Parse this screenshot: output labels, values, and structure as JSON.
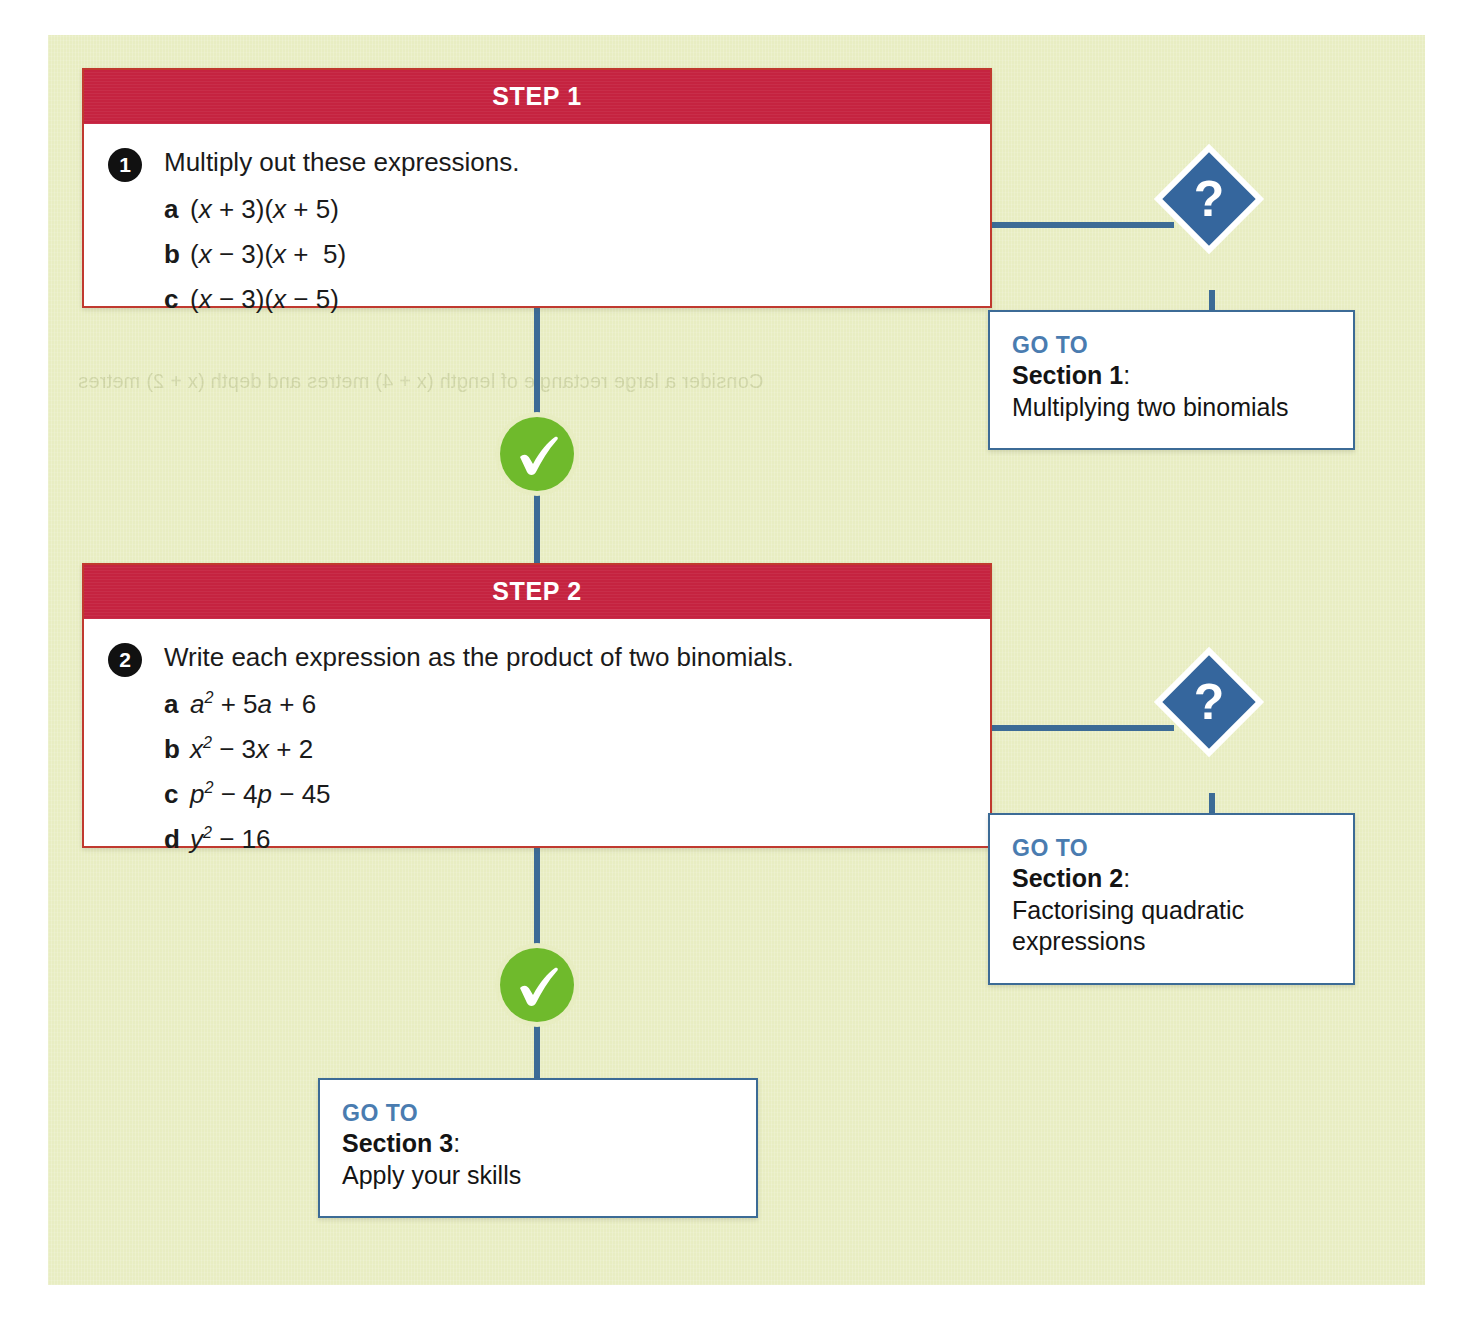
{
  "panel": {
    "background_color": "#e8edc2",
    "ghost_text_top": "Consider a large rectangle of length (x + 4) metres and depth (x + 2) metres"
  },
  "colors": {
    "red_header": "#c52340",
    "red_border": "#c0392f",
    "blue_connector": "#3c6b96",
    "blue_diamond": "#35669d",
    "goto_label_blue": "#4a7cb0",
    "green_tick": "#6fba2c",
    "bullet_black": "#111111"
  },
  "steps": [
    {
      "header": "STEP 1",
      "question": {
        "number": "1",
        "prompt": "Multiply out these expressions.",
        "parts": [
          {
            "letter": "a",
            "expression_html": "(<i>x</i> + 3)(<i>x</i> + 5)",
            "expression_text": "(x + 3)(x + 5)"
          },
          {
            "letter": "b",
            "expression_html": "(<i>x</i> &#8722; 3)(<i>x</i> +  5)",
            "expression_text": "(x − 3)(x +  5)"
          },
          {
            "letter": "c",
            "expression_html": "(<i>x</i> &#8722; 3)(<i>x</i> &#8722; 5)",
            "expression_text": "(x − 3)(x − 5)"
          }
        ]
      }
    },
    {
      "header": "STEP 2",
      "question": {
        "number": "2",
        "prompt": "Write each expression as the product of two binomials.",
        "parts": [
          {
            "letter": "a",
            "expression_html": "<i>a</i><sup>2</sup> + 5<i>a</i> + 6",
            "expression_text": "a2 + 5a + 6"
          },
          {
            "letter": "b",
            "expression_html": "<i>x</i><sup>2</sup> &#8722; 3<i>x</i> + 2",
            "expression_text": "x2 − 3x + 2"
          },
          {
            "letter": "c",
            "expression_html": "<i>p</i><sup>2</sup> &#8722; 4<i>p</i> &#8722; 45",
            "expression_text": "p2 − 4p − 45"
          },
          {
            "letter": "d",
            "expression_html": "<i>y</i><sup>2</sup> &#8722; 16",
            "expression_text": "y2 − 16"
          }
        ]
      }
    }
  ],
  "markers": {
    "question_glyph": "?",
    "tick_glyph": "check"
  },
  "goto_boxes": [
    {
      "label": "GO TO",
      "section": "Section 1",
      "colon": ":",
      "description": "Multiplying two binomials"
    },
    {
      "label": "GO TO",
      "section": "Section 2",
      "colon": ":",
      "description": "Factorising quadratic expressions"
    },
    {
      "label": "GO TO",
      "section": "Section 3",
      "colon": ":",
      "description": "Apply your skills"
    }
  ]
}
